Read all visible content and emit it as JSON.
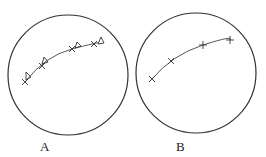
{
  "diagram": {
    "panels": [
      {
        "label": "A",
        "circle": {
          "cx": 68,
          "cy": 75,
          "r": 60
        },
        "points": [
          [
            25,
            82
          ],
          [
            42,
            66
          ],
          [
            72,
            49
          ],
          [
            94,
            44
          ]
        ],
        "markers": "cross-with-triangle"
      },
      {
        "label": "B",
        "circle": {
          "cx": 196,
          "cy": 73,
          "r": 60
        },
        "points": [
          [
            152,
            79
          ],
          [
            171,
            61
          ],
          [
            203,
            45
          ],
          [
            230,
            40
          ]
        ],
        "markers": "cross"
      }
    ],
    "colors": {
      "stroke": "#333333",
      "background": "#ffffff"
    }
  }
}
